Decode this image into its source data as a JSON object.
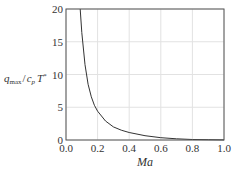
{
  "chart_data": {
    "type": "line",
    "title": "",
    "xlabel": "Ma",
    "ylabel": "q_max / c_p T*",
    "ylabel_parts": {
      "q": "q",
      "q_sub": "max",
      "sep": "/",
      "c": "c",
      "c_sub": "p",
      "T": "T",
      "T_sup": "*"
    },
    "xlim": [
      0.0,
      1.0
    ],
    "ylim": [
      0,
      20
    ],
    "x_ticks": [
      "0.0",
      "0.2",
      "0.4",
      "0.6",
      "0.8",
      "1.0"
    ],
    "y_ticks": [
      "0",
      "5",
      "10",
      "15",
      "20"
    ],
    "grid": true,
    "legend": null,
    "series": [
      {
        "name": "q_max/c_pT*",
        "color": "#333333",
        "x": [
          0.09,
          0.1,
          0.12,
          0.14,
          0.16,
          0.18,
          0.2,
          0.25,
          0.3,
          0.35,
          0.4,
          0.5,
          0.6,
          0.7,
          0.8,
          0.9,
          1.0
        ],
        "y": [
          20.0,
          16.4,
          11.5,
          8.5,
          6.6,
          5.3,
          4.4,
          2.9,
          2.0,
          1.5,
          1.15,
          0.65,
          0.35,
          0.18,
          0.08,
          0.04,
          0.02
        ]
      }
    ]
  }
}
